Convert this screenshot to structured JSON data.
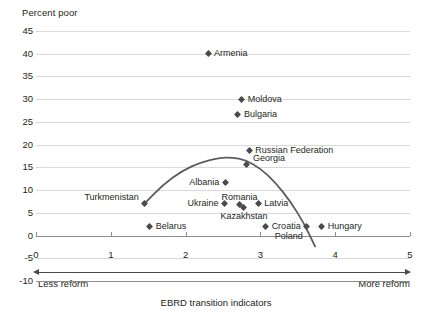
{
  "chart_data": {
    "type": "scatter",
    "title": "",
    "ylabel": "Percent poor",
    "xlabel": "EBRD transition indicators",
    "xlim": [
      0,
      5
    ],
    "ylim": [
      -10,
      45
    ],
    "yticks": [
      45,
      40,
      35,
      30,
      25,
      20,
      15,
      10,
      5,
      0,
      -5,
      -10
    ],
    "xticks": [
      0,
      1,
      2,
      3,
      4,
      5
    ],
    "grid": true,
    "legend": "none",
    "axis_annotations": {
      "left": "Less reform",
      "right": "More reform"
    },
    "points": [
      {
        "label": "Armenia",
        "x": 2.3,
        "y": 40.0,
        "label_pos": "right"
      },
      {
        "label": "Moldova",
        "x": 2.75,
        "y": 30.0,
        "label_pos": "right"
      },
      {
        "label": "Bulgaria",
        "x": 2.7,
        "y": 26.7,
        "label_pos": "right"
      },
      {
        "label": "Russian Federation",
        "x": 2.85,
        "y": 18.8,
        "label_pos": "right"
      },
      {
        "label": "Georgia",
        "x": 2.82,
        "y": 15.6,
        "label_pos": "right-up"
      },
      {
        "label": "Albania",
        "x": 2.53,
        "y": 11.6,
        "label_pos": "left"
      },
      {
        "label": "Turkmenistan",
        "x": 1.45,
        "y": 7.0,
        "label_pos": "left-up"
      },
      {
        "label": "Ukraine",
        "x": 2.52,
        "y": 7.0,
        "label_pos": "left"
      },
      {
        "label": "Romania",
        "x": 2.72,
        "y": 6.8,
        "label_pos": "up"
      },
      {
        "label": "Latvia",
        "x": 2.97,
        "y": 7.0,
        "label_pos": "right"
      },
      {
        "label": "Kazakhstan",
        "x": 2.78,
        "y": 6.2,
        "label_pos": "down"
      },
      {
        "label": "Croatia",
        "x": 3.07,
        "y": 2.0,
        "label_pos": "right"
      },
      {
        "label": "Belarus",
        "x": 1.52,
        "y": 2.0,
        "label_pos": "right"
      },
      {
        "label": "Poland",
        "x": 3.62,
        "y": 1.9,
        "label_pos": "down-left"
      },
      {
        "label": "Hungary",
        "x": 3.82,
        "y": 1.9,
        "label_pos": "right"
      }
    ],
    "fit_curve": {
      "description": "quadratic trend line",
      "x_start": 1.45,
      "x_end": 3.73,
      "points": [
        [
          1.45,
          7.0
        ],
        [
          1.7,
          11.2
        ],
        [
          1.95,
          14.2
        ],
        [
          2.2,
          16.1
        ],
        [
          2.45,
          17.1
        ],
        [
          2.62,
          17.2
        ],
        [
          2.8,
          16.6
        ],
        [
          3.0,
          14.8
        ],
        [
          3.2,
          11.7
        ],
        [
          3.4,
          7.5
        ],
        [
          3.58,
          2.8
        ],
        [
          3.73,
          -2.4
        ]
      ]
    }
  },
  "footnote": "",
  "colors": {
    "marker": "#4a4a4a",
    "curve": "#5c5c5c",
    "grid": "#d9d9d9",
    "axis": "#8c8c8c",
    "text": "#231f20"
  }
}
